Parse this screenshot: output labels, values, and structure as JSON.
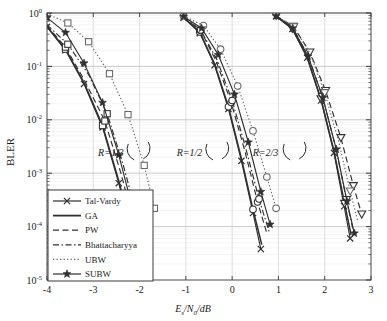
{
  "chart_data": {
    "type": "line",
    "title": "",
    "xlabel": "Es/N0/dB",
    "xlabel_parts": {
      "e": "E",
      "s": "s",
      "slash1": "/",
      "n": "N",
      "zero": "0",
      "slash2": "/dB"
    },
    "ylabel": "BLER",
    "xlim": [
      -4,
      3
    ],
    "ylim": [
      1e-05,
      1
    ],
    "yscale": "log",
    "xticks": [
      -4,
      -3,
      -2,
      -1,
      0,
      1,
      2,
      3
    ],
    "xticklabels": [
      "-4",
      "-3",
      "-2",
      "-1",
      "0",
      "1",
      "2",
      "3"
    ],
    "yticks": [
      1,
      0.1,
      0.01,
      0.001,
      0.0001,
      1e-05
    ],
    "yticklabels": [
      "10^0",
      "10^-1",
      "10^-2",
      "10^-3",
      "10^-4",
      "10^-5"
    ],
    "ytick_exponents": [
      "0",
      "-1",
      "-2",
      "-3",
      "-4",
      "-5"
    ],
    "grid": true,
    "legend_position": "lower-left",
    "annotations": [
      {
        "text": "R=1/3",
        "x": -2.62,
        "y": 0.0021
      },
      {
        "text": "R=1/2",
        "x": -0.92,
        "y": 0.0021
      },
      {
        "text": "R=2/3",
        "x": 0.72,
        "y": 0.0021
      }
    ],
    "legend": [
      {
        "label": "Tal-Vardy",
        "style": "solid",
        "marker": "x",
        "color": "#3c3c3c"
      },
      {
        "label": "GA",
        "style": "solid",
        "marker": "none",
        "color": "#2a2a2a"
      },
      {
        "label": "PW",
        "style": "dashed",
        "marker": "none",
        "color": "#2a2a2a"
      },
      {
        "label": "Bhattacharyya",
        "style": "dashdot",
        "marker": "none",
        "color": "#2a2a2a"
      },
      {
        "label": "UBW",
        "style": "dotted",
        "marker": "none",
        "color": "#555555"
      },
      {
        "label": "SUBW",
        "style": "solid",
        "marker": "star",
        "color": "#2a2a2a"
      }
    ],
    "groups": [
      {
        "name": "R=1/3",
        "group_marker": "square",
        "series": [
          {
            "name": "Tal-Vardy",
            "style": "solid",
            "marker": "x",
            "x": [
              -4.0,
              -3.6,
              -3.2,
              -2.8,
              -2.45,
              -2.15,
              -1.95
            ],
            "y": [
              0.55,
              0.2,
              0.047,
              0.0072,
              0.00065,
              6e-05,
              1.15e-05
            ]
          },
          {
            "name": "GA",
            "style": "solid",
            "marker": "none",
            "x": [
              -4.0,
              -3.6,
              -3.2,
              -2.8,
              -2.45,
              -2.15,
              -1.95
            ],
            "y": [
              0.56,
              0.21,
              0.05,
              0.0078,
              0.00072,
              6.8e-05,
              1.35e-05
            ]
          },
          {
            "name": "PW",
            "style": "dashed",
            "marker": "none",
            "x": [
              -4.0,
              -3.6,
              -3.2,
              -2.75,
              -2.4,
              -2.1,
              -1.88
            ],
            "y": [
              0.58,
              0.23,
              0.057,
              0.0095,
              0.00098,
              0.0001,
              2.05e-05
            ]
          },
          {
            "name": "Bhattacharyya",
            "style": "dashdot",
            "marker": "none",
            "x": [
              -4.0,
              -3.55,
              -3.1,
              -2.7,
              -2.35,
              -2.05,
              -1.83
            ],
            "y": [
              0.6,
              0.26,
              0.07,
              0.013,
              0.0014,
              0.00015,
              3.1e-05
            ]
          },
          {
            "name": "UBW",
            "style": "dotted",
            "marker": "square",
            "x": [
              -4.0,
              -3.55,
              -3.1,
              -2.65,
              -2.25,
              -1.9,
              -1.68
            ],
            "y": [
              0.96,
              0.65,
              0.29,
              0.073,
              0.0125,
              0.0014,
              0.00022
            ]
          },
          {
            "name": "SUBW",
            "style": "solid",
            "marker": "star",
            "x": [
              -4.0,
              -3.6,
              -3.2,
              -2.8,
              -2.45,
              -2.15,
              -1.9
            ],
            "y": [
              0.82,
              0.43,
              0.115,
              0.021,
              0.0022,
              0.00022,
              4.3e-05
            ]
          }
        ]
      },
      {
        "name": "R=1/2",
        "group_marker": "circle",
        "series": [
          {
            "name": "Tal-Vardy",
            "style": "solid",
            "marker": "x",
            "x": [
              -1.05,
              -0.7,
              -0.38,
              -0.08,
              0.2,
              0.45,
              0.62
            ],
            "y": [
              0.82,
              0.42,
              0.105,
              0.016,
              0.0017,
              0.00018,
              3.8e-05
            ]
          },
          {
            "name": "GA",
            "style": "solid",
            "marker": "none",
            "x": [
              -1.05,
              -0.7,
              -0.38,
              -0.08,
              0.2,
              0.45,
              0.64
            ],
            "y": [
              0.83,
              0.44,
              0.112,
              0.0175,
              0.0019,
              0.00021,
              4.6e-05
            ]
          },
          {
            "name": "PW",
            "style": "dashed",
            "marker": "none",
            "x": [
              -1.05,
              -0.68,
              -0.35,
              -0.02,
              0.28,
              0.55,
              0.76
            ],
            "y": [
              0.84,
              0.47,
              0.128,
              0.021,
              0.0025,
              0.00029,
              7e-05
            ]
          },
          {
            "name": "Bhattacharyya",
            "style": "dashdot",
            "marker": "none",
            "x": [
              -1.05,
              -0.68,
              -0.33,
              0.0,
              0.3,
              0.58,
              0.8
            ],
            "y": [
              0.85,
              0.48,
              0.135,
              0.023,
              0.0028,
              0.00033,
              8e-05
            ]
          },
          {
            "name": "UBW",
            "style": "dotted",
            "marker": "circle",
            "x": [
              -1.05,
              -0.62,
              -0.25,
              0.12,
              0.45,
              0.75,
              0.95
            ],
            "y": [
              0.88,
              0.58,
              0.21,
              0.043,
              0.0062,
              0.00085,
              0.00022
            ]
          },
          {
            "name": "SUBW",
            "style": "solid",
            "marker": "star",
            "x": [
              -1.05,
              -0.66,
              -0.3,
              0.05,
              0.35,
              0.62,
              0.82
            ],
            "y": [
              0.86,
              0.52,
              0.165,
              0.03,
              0.0038,
              0.00045,
              0.00011
            ]
          }
        ]
      },
      {
        "name": "R=2/3",
        "group_marker": "triangle-down",
        "series": [
          {
            "name": "Tal-Vardy",
            "style": "solid",
            "marker": "x",
            "x": [
              0.95,
              1.3,
              1.62,
              1.92,
              2.2,
              2.42,
              2.55
            ],
            "y": [
              0.87,
              0.5,
              0.145,
              0.023,
              0.0024,
              0.00024,
              6e-05
            ]
          },
          {
            "name": "GA",
            "style": "solid",
            "marker": "none",
            "x": [
              0.95,
              1.3,
              1.62,
              1.92,
              2.2,
              2.43,
              2.57
            ],
            "y": [
              0.875,
              0.51,
              0.15,
              0.0245,
              0.0026,
              0.00027,
              7e-05
            ]
          },
          {
            "name": "PW",
            "style": "dashed",
            "marker": "triangle-down",
            "x": [
              0.95,
              1.32,
              1.68,
              2.02,
              2.35,
              2.62,
              2.8
            ],
            "y": [
              0.89,
              0.56,
              0.185,
              0.035,
              0.0046,
              0.00058,
              0.00017
            ]
          },
          {
            "name": "Bhattacharyya",
            "style": "dashdot",
            "marker": "none",
            "x": [
              0.95,
              1.31,
              1.64,
              1.95,
              2.24,
              2.47,
              2.62
            ],
            "y": [
              0.88,
              0.53,
              0.16,
              0.027,
              0.003,
              0.00032,
              8e-05
            ]
          },
          {
            "name": "UBW",
            "style": "dotted",
            "marker": "none",
            "x": [
              0.95,
              1.33,
              1.68,
              2.0,
              2.3,
              2.55,
              2.72
            ],
            "y": [
              0.89,
              0.55,
              0.178,
              0.032,
              0.004,
              0.00046,
              0.00012
            ]
          },
          {
            "name": "SUBW",
            "style": "solid",
            "marker": "star",
            "x": [
              0.95,
              1.31,
              1.64,
              1.96,
              2.25,
              2.48,
              2.64
            ],
            "y": [
              0.878,
              0.52,
              0.155,
              0.026,
              0.0028,
              0.0003,
              7.5e-05
            ]
          }
        ]
      }
    ],
    "arc_markers": [
      {
        "group": "R=1/3",
        "x": -2.05,
        "y": 0.0022
      },
      {
        "group": "R=1/2",
        "x": -0.35,
        "y": 0.0022
      },
      {
        "group": "R=2/3",
        "x": 1.32,
        "y": 0.0022
      }
    ]
  }
}
